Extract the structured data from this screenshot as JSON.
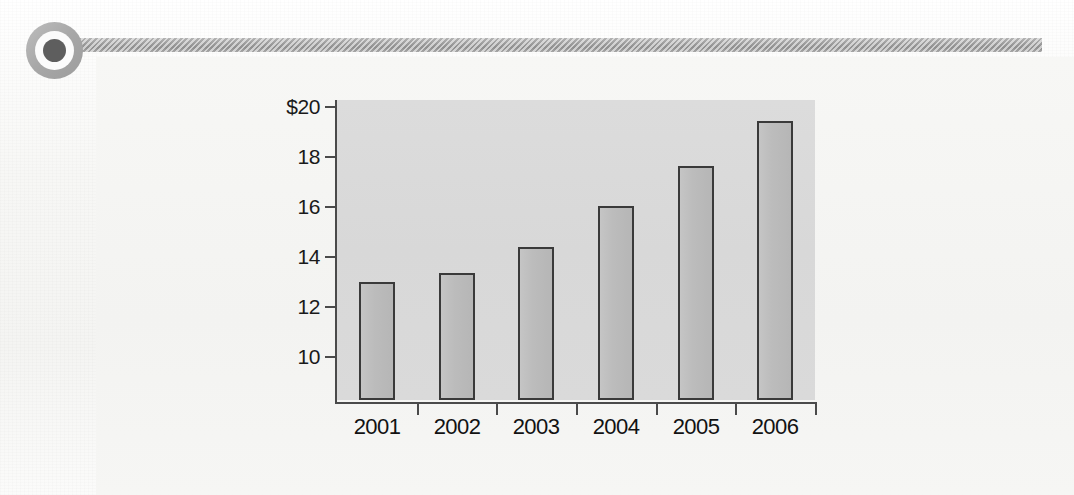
{
  "header": {
    "bullet_icon": "circle-bullet-icon",
    "rule_icon": "horizontal-rule-icon"
  },
  "chart_data": {
    "type": "bar",
    "title": "",
    "subtitle": "",
    "xlabel": "",
    "ylabel": "",
    "categories": [
      "2001",
      "2002",
      "2003",
      "2004",
      "2005",
      "2006"
    ],
    "values": [
      13.0,
      13.35,
      14.4,
      16.05,
      17.65,
      19.45
    ],
    "ylim": [
      9.0,
      20.0
    ],
    "ytick_values": [
      20,
      18,
      16,
      14,
      12,
      10
    ],
    "ytick_labels": [
      "$20",
      "18",
      "16",
      "14",
      "12",
      "10"
    ],
    "grid": false,
    "legend": false,
    "legend_position": "none",
    "colors": {
      "bar_fill": "#bcbcbc",
      "bar_edge": "#3a3a3a",
      "plot_background": "#d9d9d9",
      "axis": "#4a4a4a",
      "text": "#121212",
      "page_background": "#f6f6f4",
      "ornament": "#9a9a9a"
    }
  }
}
